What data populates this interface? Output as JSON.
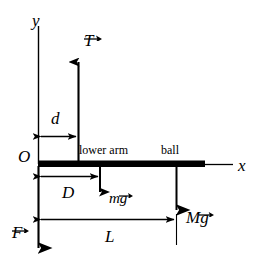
{
  "figure": {
    "type": "free-body-diagram",
    "title": "",
    "background_color": "#ffffff",
    "stroke_color": "#000000",
    "width": 270,
    "height": 273
  },
  "axes": {
    "y_label": "y",
    "x_label": "x",
    "origin_label": "O"
  },
  "annotations": {
    "lower_arm_label": "lower arm",
    "ball_label": "ball"
  },
  "vectors": [
    {
      "name": "tension",
      "label": "T",
      "arrow_over": "T",
      "direction": "up"
    },
    {
      "name": "arm-weight",
      "label_lead": "m",
      "label_tail": "g",
      "arrow_over": "g",
      "direction": "down"
    },
    {
      "name": "ball-weight",
      "label_lead": "M",
      "label_tail": "g",
      "arrow_over": "g",
      "direction": "down"
    },
    {
      "name": "joint-force",
      "label": "F",
      "arrow_over": "F",
      "direction": "down"
    }
  ],
  "dimensions": [
    {
      "name": "d",
      "label": "d",
      "from": "origin",
      "to": "tension-line"
    },
    {
      "name": "D",
      "label": "D",
      "from": "origin",
      "to": "arm-weight-line"
    },
    {
      "name": "L",
      "label": "L",
      "from": "origin",
      "to": "ball-weight-line"
    }
  ]
}
